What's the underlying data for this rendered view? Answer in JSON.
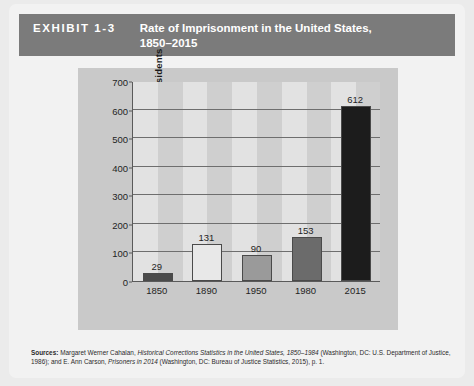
{
  "header": {
    "exhibit_label": "EXHIBIT 1-3",
    "title_line1": "Rate of Imprisonment in the United States,",
    "title_line2": "1850–2015",
    "background_color": "#7b7b7b",
    "text_color": "#ffffff"
  },
  "chart_data": {
    "type": "bar",
    "title": "Rate of Imprisonment in the United States, 1850–2015",
    "xlabel": "",
    "ylabel": "Rate per 100,000 residents",
    "categories": [
      "1850",
      "1890",
      "1950",
      "1980",
      "2015"
    ],
    "values": [
      29,
      131,
      90,
      153,
      612
    ],
    "value_labels": [
      "29",
      "131",
      "90",
      "153",
      "612"
    ],
    "bar_colors": [
      "#4a4a4a",
      "#e8e8e8",
      "#9a9a9a",
      "#6b6b6b",
      "#1c1c1c"
    ],
    "ylim": [
      0,
      700
    ],
    "yticks": [
      0,
      100,
      200,
      300,
      400,
      500,
      600,
      700
    ],
    "ytick_labels": [
      "0",
      "100",
      "200",
      "300",
      "400",
      "500",
      "600",
      "700"
    ],
    "grid": true,
    "legend": "none",
    "plot_background_band_light": "#e2e2e2",
    "plot_background_band_dark": "#cfcfcf",
    "panel_background": "#c9c9c9"
  },
  "sources": {
    "label": "Sources:",
    "part1": " Margaret Werner Cahalan, ",
    "title1": "Historical Corrections Statistics in the United States, 1850–1984",
    "part2": " (Washington, DC: U.S. Department of Justice, 1986); and E. Ann Carson, ",
    "title2": "Prisoners in 2014",
    "part3": " (Washington, DC: Bureau of Justice Statistics, 2015), p. 1."
  }
}
